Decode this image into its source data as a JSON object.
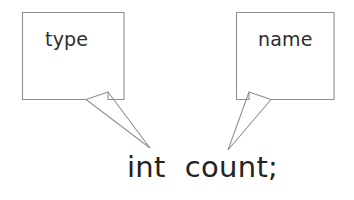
{
  "diagram": {
    "background_color": "#ffffff",
    "stroke_color": "#8d8d8d",
    "text_color": "#232323",
    "callouts": [
      {
        "id": "type-callout",
        "label": "type",
        "box": {
          "x": 22,
          "y": 12,
          "width": 102,
          "height": 88
        },
        "tail_tip": {
          "x": 150,
          "y": 148
        },
        "points_to": "int"
      },
      {
        "id": "name-callout",
        "label": "name",
        "box": {
          "x": 236,
          "y": 12,
          "width": 98,
          "height": 88
        },
        "tail_tip": {
          "x": 228,
          "y": 150
        },
        "points_to": "count"
      }
    ],
    "code": {
      "text": "int  count;",
      "tokens": [
        {
          "name": "type-token",
          "text": "int"
        },
        {
          "name": "name-token",
          "text": "count"
        },
        {
          "name": "terminator-token",
          "text": ";"
        }
      ]
    }
  },
  "geometry": {
    "left_box_path": "M 22.5 12.5 L 124 12.5 L 124 99.5 L 108 99.5 L 108 92 L 86 99.5 L 22.5 99.5 Z",
    "left_tail_a": "M 86 99.5 L 150 148",
    "left_tail_b": "M 108 92 L 150 148",
    "right_box_path": "M 236.5 12.5 L 334 12.5 L 334 99.5 L 271 99.5 L 249 92 L 249 99.5 L 236.5 99.5 Z",
    "right_tail_a": "M 271 99.5 L 228 150",
    "right_tail_b": "M 249 92 L 228 150"
  }
}
